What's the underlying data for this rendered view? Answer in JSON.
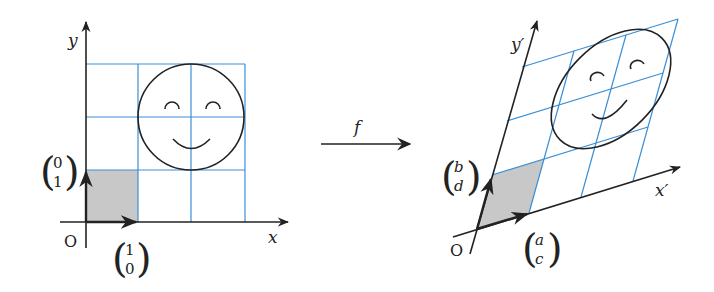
{
  "colors": {
    "grid": "#3a8fd6",
    "axis": "#222222",
    "shade": "#c8c8c8",
    "curve": "#222222"
  },
  "left": {
    "origin_label": "O",
    "x_axis_label": "x",
    "y_axis_label": "y",
    "e1": {
      "top": "1",
      "bottom": "0"
    },
    "e2": {
      "top": "0",
      "bottom": "1"
    }
  },
  "mapping": {
    "label": "f"
  },
  "right": {
    "origin_label": "O",
    "x_axis_label": "x′",
    "y_axis_label": "y′",
    "e1": {
      "top": "a",
      "bottom": "c"
    },
    "e2": {
      "top": "b",
      "bottom": "d"
    }
  }
}
